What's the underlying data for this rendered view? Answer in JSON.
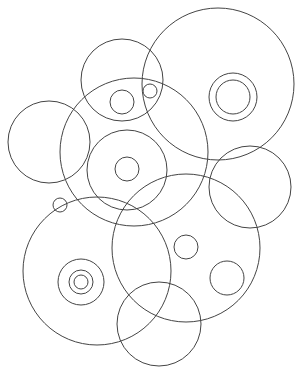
{
  "diagram": {
    "title": "",
    "background": "#ffffff",
    "stroke_color": "#444444",
    "width": 299,
    "height": 373,
    "circles": [
      {
        "id": "top-center",
        "cx": 122,
        "cy": 80,
        "r": 41
      },
      {
        "id": "top-center-inner",
        "cx": 122,
        "cy": 102,
        "r": 12
      },
      {
        "id": "top-center-tiny",
        "cx": 150,
        "cy": 91,
        "r": 7
      },
      {
        "id": "top-right-large",
        "cx": 218,
        "cy": 84,
        "r": 76
      },
      {
        "id": "top-right-ring-outer",
        "cx": 233,
        "cy": 97,
        "r": 24
      },
      {
        "id": "top-right-ring-inner",
        "cx": 233,
        "cy": 97,
        "r": 17
      },
      {
        "id": "left",
        "cx": 49,
        "cy": 142,
        "r": 41
      },
      {
        "id": "middle-large",
        "cx": 134,
        "cy": 152,
        "r": 74
      },
      {
        "id": "middle-inner",
        "cx": 127,
        "cy": 170,
        "r": 40
      },
      {
        "id": "middle-inner-small",
        "cx": 127,
        "cy": 169,
        "r": 12
      },
      {
        "id": "right-mid",
        "cx": 250,
        "cy": 187,
        "r": 41
      },
      {
        "id": "lower-right-large",
        "cx": 186,
        "cy": 248,
        "r": 74
      },
      {
        "id": "lower-right-small-a",
        "cx": 186,
        "cy": 247,
        "r": 12
      },
      {
        "id": "lower-right-small-b",
        "cx": 227,
        "cy": 278,
        "r": 17
      },
      {
        "id": "lower-left-large",
        "cx": 97,
        "cy": 271,
        "r": 74
      },
      {
        "id": "lower-left-ring-outer",
        "cx": 81,
        "cy": 282,
        "r": 23
      },
      {
        "id": "lower-left-ring-mid",
        "cx": 81,
        "cy": 282,
        "r": 12
      },
      {
        "id": "lower-left-ring-inner",
        "cx": 81,
        "cy": 282,
        "r": 7
      },
      {
        "id": "lower-left-tiny",
        "cx": 60,
        "cy": 205,
        "r": 7
      },
      {
        "id": "bottom",
        "cx": 159,
        "cy": 324,
        "r": 42
      }
    ]
  }
}
